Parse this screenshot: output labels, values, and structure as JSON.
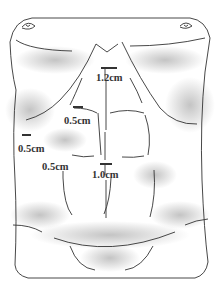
{
  "figure": {
    "colors": {
      "line": "#333333",
      "shade": "#bdbdbd",
      "background": "#ffffff"
    },
    "measurements": [
      {
        "id": "upper-midline",
        "label": "1.2cm",
        "x": 96,
        "y": 73,
        "bar_x": 101,
        "bar_y": 68,
        "bar_w": 16
      },
      {
        "id": "left-upper-rectus",
        "label": "0.5cm",
        "x": 64,
        "y": 116,
        "bar_x": 73,
        "bar_y": 107,
        "bar_w": 10
      },
      {
        "id": "left-flank",
        "label": "0.5cm",
        "x": 18,
        "y": 144,
        "bar_x": 22,
        "bar_y": 135,
        "bar_w": 9
      },
      {
        "id": "left-lower-rectus",
        "label": "0.5cm",
        "x": 42,
        "y": 162,
        "bar_x": null,
        "bar_y": null,
        "bar_w": null
      },
      {
        "id": "lower-midline",
        "label": "1.0cm",
        "x": 92,
        "y": 170,
        "bar_x": 101,
        "bar_y": 164,
        "bar_w": 12
      }
    ]
  }
}
